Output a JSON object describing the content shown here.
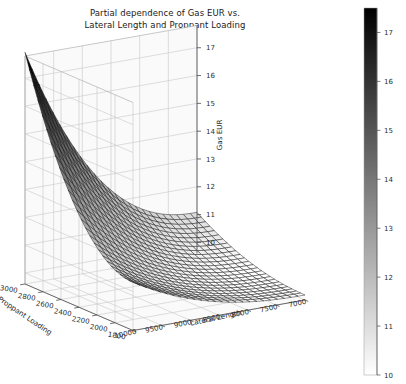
{
  "figure": {
    "title_line1": "Partial dependence of Gas EUR vs.",
    "title_line2": "Lateral Length and Proppant Loading",
    "background": "#ffffff",
    "width": 406,
    "height": 384
  },
  "chart_data": {
    "type": "surface",
    "title": "Partial dependence of Gas EUR vs. Lateral Length and Proppant Loading",
    "xlabel": "Lateral Length",
    "ylabel": "Proppant Loading",
    "zlabel": "Gas EUR",
    "colormap": "binary",
    "grid": true,
    "projection": "3d",
    "x_ticks": [
      10000,
      9500,
      9000,
      8500,
      8000,
      7500,
      7000
    ],
    "y_ticks": [
      3000,
      2800,
      2600,
      2400,
      2200,
      2000,
      1800
    ],
    "z_ticks": [
      10,
      11,
      12,
      13,
      14,
      15,
      16,
      17
    ],
    "xlim": [
      6800,
      10200
    ],
    "ylim": [
      1700,
      3100
    ],
    "zlim": [
      9.6,
      17.8
    ],
    "x_label_order": [
      "10000",
      "9500",
      "9000",
      "8500",
      "8000",
      "7500",
      "7000"
    ],
    "y_label_order": [
      "3000",
      "2800",
      "2600",
      "2400",
      "2200",
      "2000",
      "1800"
    ],
    "z_label_order": [
      "17",
      "16",
      "15",
      "14",
      "13",
      "12",
      "11",
      "10"
    ],
    "mesh_n_x": 26,
    "mesh_n_y": 26,
    "surface_model": {
      "description": "Gas EUR increases sharply with both Lateral Length and Proppant Loading; steep convex rise toward the far corner (high lateral length, high proppant loading).",
      "z_min": 9.9,
      "z_max": 17.6,
      "corner_values": {
        "low_x_low_y": 9.9,
        "high_x_low_y": 11.6,
        "low_x_high_y": 11.4,
        "high_x_high_y": 17.6
      }
    },
    "colorbar": {
      "label": "Gas EUR",
      "vmin": 10,
      "vmax": 17.5,
      "ticks": [
        10,
        11,
        12,
        13,
        14,
        15,
        16,
        17
      ],
      "orientation": "vertical",
      "position": "right",
      "low_color": "#ffffff",
      "high_color": "#000000"
    }
  },
  "axes": {
    "pane_color": "#fafafa",
    "grid_color": "#c8c8c8",
    "axis_line_color": "#4a4a4a",
    "tick_text_color": "#2b2b2b"
  }
}
